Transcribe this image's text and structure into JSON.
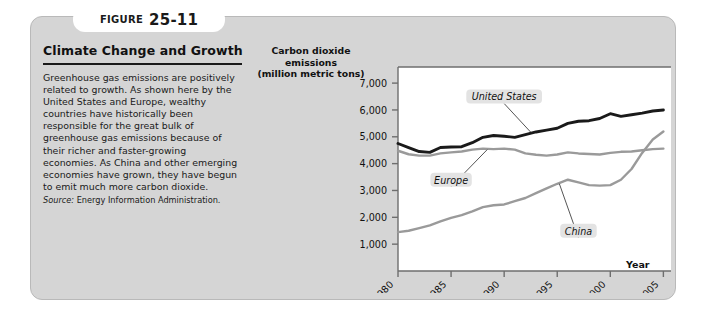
{
  "figure": {
    "label_word": "FIGURE",
    "number": "25-11"
  },
  "panel": {
    "title": "Climate Change and Growth",
    "body": "Greenhouse gas emissions are positively related to growth. As shown here by the United States and Europe, wealthy countries have historically been responsible for the great bulk of greenhouse gas emissions because of their richer and faster-growing economies. As China and other emerging economies have grown, they have begun to emit much more carbon dioxide.",
    "source_label": "Source:",
    "source_text": "Energy Information Administration."
  },
  "chart_data": {
    "type": "line",
    "title": "",
    "ylabel": "Carbon dioxide emissions (million metric tons)",
    "ylabel_lines": [
      "Carbon dioxide",
      "emissions",
      "(million metric tons)"
    ],
    "xlabel": "Year",
    "xlim": [
      1980,
      2006
    ],
    "ylim": [
      0,
      7600
    ],
    "ytick_values": [
      1000,
      2000,
      3000,
      4000,
      5000,
      6000,
      7000
    ],
    "ytick_labels": [
      "1,000",
      "2,000",
      "3,000",
      "4,000",
      "5,000",
      "6,000",
      "7,000"
    ],
    "xtick_values": [
      1980,
      1985,
      1990,
      1995,
      2000,
      2005
    ],
    "xtick_labels": [
      "1980",
      "1985",
      "1990",
      "1995",
      "2000",
      "2005"
    ],
    "grid": false,
    "legend_position": "inline-annotations",
    "x": [
      1980,
      1981,
      1982,
      1983,
      1984,
      1985,
      1986,
      1987,
      1988,
      1989,
      1990,
      1991,
      1992,
      1993,
      1994,
      1995,
      1996,
      1997,
      1998,
      1999,
      2000,
      2001,
      2002,
      2003,
      2004,
      2005
    ],
    "series": [
      {
        "name": "United States",
        "color": "#1a1a1a",
        "values": [
          4750,
          4600,
          4450,
          4420,
          4600,
          4620,
          4630,
          4780,
          4980,
          5050,
          5020,
          4980,
          5080,
          5180,
          5250,
          5320,
          5500,
          5580,
          5600,
          5680,
          5860,
          5760,
          5820,
          5880,
          5960,
          6000
        ],
        "annotation": {
          "label": "United States",
          "x": 1990,
          "y": 6500
        }
      },
      {
        "name": "Europe",
        "color": "#9a9a9a",
        "values": [
          4480,
          4350,
          4300,
          4300,
          4380,
          4420,
          4450,
          4520,
          4560,
          4540,
          4560,
          4520,
          4380,
          4330,
          4300,
          4340,
          4420,
          4380,
          4360,
          4340,
          4400,
          4440,
          4450,
          4500,
          4540,
          4560
        ],
        "annotation": {
          "label": "Europe",
          "x": 1985,
          "y": 3400
        }
      },
      {
        "name": "China",
        "color": "#9a9a9a",
        "values": [
          1450,
          1500,
          1600,
          1700,
          1850,
          1980,
          2080,
          2220,
          2380,
          2450,
          2480,
          2600,
          2720,
          2900,
          3080,
          3250,
          3400,
          3300,
          3200,
          3180,
          3200,
          3400,
          3800,
          4400,
          4900,
          5200
        ],
        "annotation": {
          "label": "China",
          "x": 1997,
          "y": 1500
        }
      }
    ]
  }
}
